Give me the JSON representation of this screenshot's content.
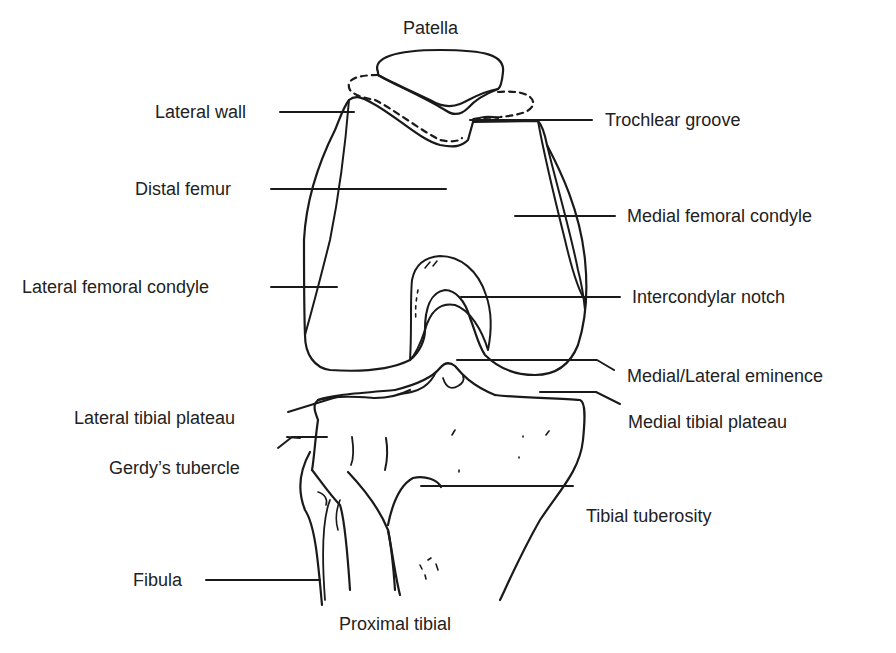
{
  "diagram": {
    "line_color": "#1a1a1a",
    "labels": {
      "patella": "Patella",
      "lateral_wall": "Lateral wall",
      "trochlear_groove": "Trochlear groove",
      "distal_femur": "Distal femur",
      "medial_femoral_condyle": "Medial femoral condyle",
      "lateral_femoral_condyle": "Lateral femoral condyle",
      "intercondylar_notch": "Intercondylar notch",
      "medial_lateral_eminence": "Medial/Lateral eminence",
      "lateral_tibial_plateau": "Lateral tibial plateau",
      "medial_tibial_plateau": "Medial tibial plateau",
      "gerdys_tubercle": "Gerdy’s tubercle",
      "tibial_tuberosity": "Tibial tuberosity",
      "fibula": "Fibula",
      "proximal_tibial": "Proximal tibial"
    }
  }
}
